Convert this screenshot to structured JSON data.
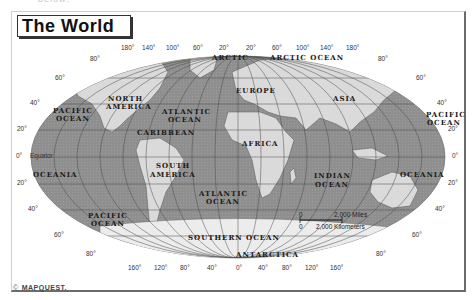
{
  "top_cutoff_text": "below:",
  "title": "The World",
  "credit": {
    "symbol": "©",
    "brand": "MAPQUEST."
  },
  "colors": {
    "ocean": "#8f8f8f",
    "land": "#d9d9d9",
    "antarctica": "#ececec",
    "grid": "#4a4a4a",
    "frame": "#6b6b6b"
  },
  "longitude_labels_top": [
    "180°",
    "140°",
    "100°",
    "60°",
    "20°",
    "20°",
    "60°",
    "100°",
    "140°",
    "180°"
  ],
  "longitude_labels_bottom": [
    "160°",
    "120°",
    "80°",
    "40°",
    "0°",
    "40°",
    "80°",
    "120°",
    "160°"
  ],
  "latitude_labels_left": [
    "80°",
    "60°",
    "40°",
    "20°",
    "0°",
    "20°",
    "40°",
    "60°",
    "80°"
  ],
  "latitude_labels_right": [
    "80°",
    "60°",
    "40°",
    "20°",
    "0°",
    "20°",
    "40°",
    "60°",
    "80°"
  ],
  "equator_label": "Equator",
  "regions": {
    "arctic_left": "ARCTIC",
    "arctic_ocean": "ARCTIC OCEAN",
    "north_america": [
      "NORTH",
      "AMERICA"
    ],
    "europe": "EUROPE",
    "asia": "ASIA",
    "pacific_left": [
      "PACIFIC",
      "OCEAN"
    ],
    "atlantic_north": [
      "ATLANTIC",
      "OCEAN"
    ],
    "pacific_right": [
      "PACIFIC",
      "OCEAN"
    ],
    "caribbean": "CARIBBEAN",
    "africa": "AFRICA",
    "south_america": [
      "SOUTH",
      "AMERICA"
    ],
    "oceania_left": "OCEANIA",
    "oceania_right": "OCEANIA",
    "indian_ocean": [
      "INDIAN",
      "OCEAN"
    ],
    "atlantic_south": [
      "ATLANTIC",
      "OCEAN"
    ],
    "pacific_south": [
      "PACIFIC",
      "OCEAN"
    ],
    "southern_ocean": "SOUTHERN OCEAN",
    "antarctica": "ANTARCTICA"
  },
  "scale": {
    "miles_start": "0",
    "miles_label": "2,000 Miles",
    "km_start": "0",
    "km_label": "2,000 Kilometers"
  }
}
